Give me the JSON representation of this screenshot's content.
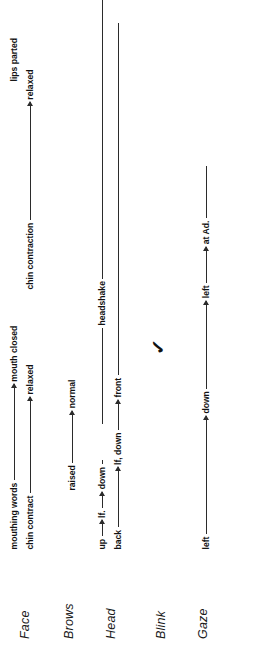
{
  "figure": {
    "type": "behaviour-annotation-timeline",
    "orientation": "rotated-90-ccw",
    "rows": [
      {
        "id": "face",
        "label": "Face",
        "tracks": [
          {
            "id": "face-mouth",
            "segments": [
              {
                "kind": "text",
                "text": "mouthing words"
              },
              {
                "kind": "arrow",
                "length": 96
              },
              {
                "kind": "text",
                "text": "mouth closed"
              }
            ]
          },
          {
            "id": "face-chin",
            "segments": [
              {
                "kind": "text",
                "text": "chin contract"
              },
              {
                "kind": "arrow",
                "length": 96
              },
              {
                "kind": "text",
                "text": "relaxed"
              }
            ]
          },
          {
            "id": "face-chin-contraction",
            "segments": [
              {
                "kind": "text",
                "text": "chin contraction"
              },
              {
                "kind": "arrow",
                "length": 118
              },
              {
                "kind": "text",
                "text": "relaxed"
              }
            ]
          },
          {
            "id": "face-lips",
            "segments": [
              {
                "kind": "text",
                "text": "lips parted"
              }
            ]
          }
        ]
      },
      {
        "id": "brows",
        "label": "Brows",
        "tracks": [
          {
            "id": "brows-main",
            "segments": [
              {
                "kind": "text",
                "text": "raised"
              },
              {
                "kind": "arrow",
                "length": 52
              },
              {
                "kind": "text",
                "text": "normal"
              }
            ]
          }
        ]
      },
      {
        "id": "head",
        "label": "Head",
        "tracks": [
          {
            "id": "head-upper",
            "segments": [
              {
                "kind": "text",
                "text": "up"
              },
              {
                "kind": "arrow",
                "length": 16
              },
              {
                "kind": "text",
                "text": "lf."
              },
              {
                "kind": "arrow",
                "length": 16
              },
              {
                "kind": "text",
                "text": "down"
              },
              {
                "kind": "rule",
                "length": 4
              },
              {
                "kind": "text",
                "text": "headshake"
              }
            ]
          },
          {
            "id": "head-lower",
            "segments": [
              {
                "kind": "text",
                "text": "back"
              },
              {
                "kind": "arrow",
                "length": 60
              },
              {
                "kind": "text",
                "text": "lf, down"
              },
              {
                "kind": "arrow",
                "length": 30
              },
              {
                "kind": "text",
                "text": "front"
              }
            ]
          }
        ]
      },
      {
        "id": "blink",
        "label": "Blink",
        "marks": [
          {
            "id": "blink-mark-1",
            "glyph": "✓"
          }
        ],
        "tracks": []
      },
      {
        "id": "gaze",
        "label": "Gaze",
        "tracks": [
          {
            "id": "gaze-main",
            "segments": [
              {
                "kind": "text",
                "text": "left"
              },
              {
                "kind": "arrow",
                "length": 118
              },
              {
                "kind": "text",
                "text": "down"
              },
              {
                "kind": "arrow",
                "length": 88
              },
              {
                "kind": "text",
                "text": "left"
              },
              {
                "kind": "arrow",
                "length": 36
              },
              {
                "kind": "text",
                "text": "at Ad."
              }
            ]
          }
        ]
      }
    ]
  },
  "colors": {
    "ink": "#1a1a1a",
    "rule": "#2b2b2b",
    "background": "#ffffff"
  }
}
